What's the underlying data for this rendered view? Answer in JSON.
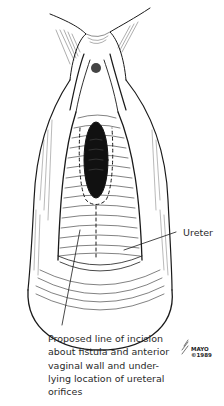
{
  "figure": {
    "type": "anatomical illustration"
  },
  "labels": {
    "ureter": "Ureter",
    "incision": "Proposed line of incision\nabout fistula and anterior\nvaginal wall and under-\nlying location of ureteral\norifices"
  },
  "credit": {
    "org": "MAYO",
    "copyright": "©1989"
  },
  "colors": {
    "ink": "#1a1a1a",
    "background": "#ffffff"
  }
}
